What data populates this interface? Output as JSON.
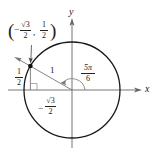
{
  "diagram": {
    "type": "unit-circle",
    "x_axis_label": "x",
    "y_axis_label": "y",
    "radius_label": "1",
    "angle": {
      "num": "5π",
      "den": "6"
    },
    "point": {
      "open_paren": "(",
      "x_sign": "−",
      "x_num": "√3",
      "x_den": "2",
      "comma": ",",
      "y_num": "1",
      "y_den": "2",
      "close_paren": ")"
    },
    "vertical_leg": {
      "num": "1",
      "den": "2"
    },
    "horizontal_leg": {
      "sign": "−",
      "num": "√3",
      "den": "2"
    },
    "colors": {
      "stroke": "#222222",
      "axis": "#555555",
      "background": "#ffffff"
    }
  }
}
